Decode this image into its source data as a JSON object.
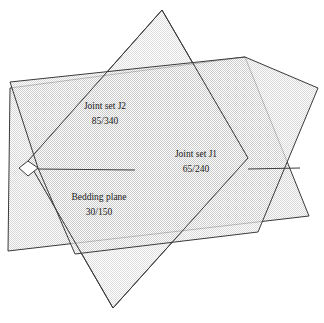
{
  "diagram": {
    "type": "geological-plane-block-diagram",
    "background_color": "#ffffff",
    "stroke_color": "#3a3a3a",
    "labels": {
      "joint_set_j2": {
        "name": "Joint set J2",
        "orientation": "85/340",
        "dip": "85",
        "dip_direction": "340"
      },
      "joint_set_j1": {
        "name": "Joint set J1",
        "orientation": "65/240",
        "dip": "65",
        "dip_direction": "240"
      },
      "bedding_plane": {
        "name": "Bedding plane",
        "orientation": "30/150",
        "dip": "30",
        "dip_direction": "150"
      }
    },
    "planes": [
      {
        "id": "joint-set-j1",
        "label": "Joint set J1",
        "fill": "#ededed",
        "opacity": "0.88",
        "points": "162,10 248,158 113,308 28,161"
      },
      {
        "id": "joint-set-j2",
        "label": "Joint set J2",
        "fill": "#e4e4e4",
        "opacity": "0.82",
        "points": "10,88 245,57 309,216 8,251"
      },
      {
        "id": "bedding-plane",
        "label": "Bedding plane",
        "fill": "#e9e9e9",
        "opacity": "0.80",
        "points": "10,82 245,57 318,88 258,232 75,254 38,168"
      }
    ],
    "label_positions": {
      "joint_set_j2": {
        "x": 105,
        "y": 107,
        "x2": 105,
        "y2": 122
      },
      "joint_set_j1": {
        "x": 196,
        "y": 155,
        "x2": 196,
        "y2": 170
      },
      "bedding_plane": {
        "x": 99,
        "y": 198,
        "x2": 99,
        "y2": 213
      }
    }
  }
}
